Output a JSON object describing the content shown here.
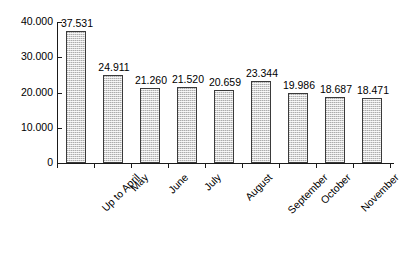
{
  "chart_data": {
    "type": "bar",
    "title": "",
    "subtitle": "",
    "xlabel": "",
    "ylabel": "",
    "grid": false,
    "legend": false,
    "legend_position": "none",
    "ylim": [
      0,
      40000
    ],
    "y_ticks": [
      0,
      10000,
      20000,
      30000,
      40000
    ],
    "y_tick_labels": [
      "0",
      "10.000",
      "20.000",
      "30.000",
      "40.000"
    ],
    "thousands_separator": ".",
    "categories": [
      "Up to April",
      "May",
      "June",
      "July",
      "August",
      "September",
      "October",
      "November",
      "December (estimated)"
    ],
    "values": [
      37531,
      24911,
      21260,
      21520,
      20659,
      23344,
      19986,
      18687,
      18471
    ],
    "value_labels": [
      "37.531",
      "24.911",
      "21.260",
      "21.520",
      "20.659",
      "23.344",
      "19.986",
      "18.687",
      "18.471"
    ],
    "bar_color": "#d4d4d4",
    "bar_edge_color": "#3a3a3a",
    "axis_color": "#1a1a1a",
    "text_color": "#000000",
    "background_color": "#ffffff"
  }
}
